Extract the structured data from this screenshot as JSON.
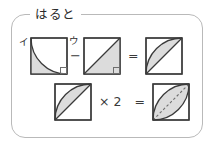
{
  "panel": {
    "title": "はると",
    "border_color": "#b9b9b9"
  },
  "colors": {
    "shape_stroke": "#3a3a3a",
    "shape_fill": "#dcdcdc",
    "text": "#2b2b2b",
    "panel_border": "#b9b9b9",
    "white": "#ffffff"
  },
  "equations": [
    {
      "id": "equation-top",
      "terms": [
        {
          "kind": "figure",
          "name": "quarter-circle-segment",
          "label": "イ",
          "description": "square with quarter-circle arc, region under arc shaded, right-angle mark at bottom-right"
        },
        {
          "kind": "operator",
          "name": "minus",
          "label": "−",
          "kana": "ウ"
        },
        {
          "kind": "figure",
          "name": "triangle-half-square",
          "label": "",
          "description": "square with diagonal from bottom-left to top-right, lower triangle shaded, right-angle mark at bottom-right"
        },
        {
          "kind": "operator",
          "name": "equals",
          "label": "="
        },
        {
          "kind": "figure",
          "name": "crescent-segment",
          "label": "",
          "description": "square with crescent region between arc and diagonal shaded"
        }
      ]
    },
    {
      "id": "equation-bottom",
      "terms": [
        {
          "kind": "figure",
          "name": "crescent-segment",
          "label": "",
          "description": "square with crescent region between arc and diagonal shaded"
        },
        {
          "kind": "operator",
          "name": "multiply",
          "label": "× 2"
        },
        {
          "kind": "operator",
          "name": "equals",
          "label": "="
        },
        {
          "kind": "figure",
          "name": "vesica-leaf",
          "label": "",
          "description": "square with leaf/vesica region formed by two arcs, shaded, dashed diagonal through it"
        }
      ]
    }
  ]
}
